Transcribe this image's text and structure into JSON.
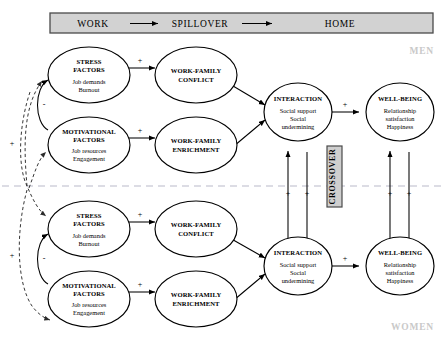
{
  "header": {
    "work": "WORK",
    "spillover": "SPILLOVER",
    "home": "HOME"
  },
  "gender_labels": {
    "top": "MEN",
    "bottom": "WOMEN"
  },
  "crossover": {
    "label": "CROSSOVER"
  },
  "signs": {
    "plus": "+",
    "minus": "-"
  },
  "nodes": {
    "stress": {
      "title_line1": "STRESS",
      "title_line2": "FACTORS",
      "sub_line1": "Job demands",
      "sub_line2": "Burnout"
    },
    "motivational": {
      "title_line1": "MOTIVATIONAL",
      "title_line2": "FACTORS",
      "sub_line1": "Job resources",
      "sub_line2": "Engagement"
    },
    "conflict": {
      "title_line1": "WORK-FAMILY",
      "title_line2": "CONFLICT"
    },
    "enrichment": {
      "title_line1": "WORK-FAMILY",
      "title_line2": "ENRICHMENT"
    },
    "interaction": {
      "title_line1": "INTERACTION",
      "sub_line1": "Social support",
      "sub_line2": "Social",
      "sub_line3": "undermining"
    },
    "wellbeing": {
      "title_line1": "WELL-BEING",
      "sub_line1": "Relationship",
      "sub_line2": "satisfaction",
      "sub_line3": "Happiness"
    }
  },
  "colors": {
    "header_fill": "#d2d2d2",
    "crossover_fill": "#cfcfcf",
    "divider": "#b9b9c9",
    "gender_text": "#c9c9c9",
    "stroke": "#000000"
  }
}
